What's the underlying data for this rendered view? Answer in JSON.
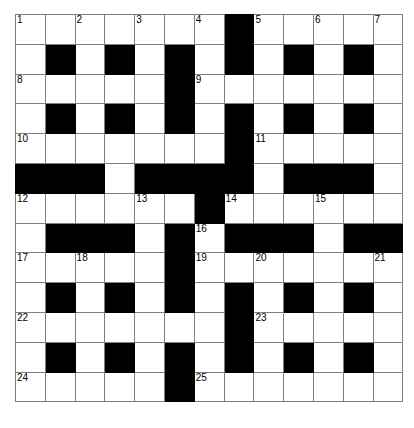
{
  "puzzle": {
    "kind": "crossword-grid",
    "rows": 13,
    "cols": 13,
    "cell_size_px": 28.8,
    "colors": {
      "fill": "#ffffff",
      "block": "#000000",
      "line": "#7f7f7f",
      "number": "#000000"
    },
    "grid": [
      [
        "w",
        "w",
        "w",
        "w",
        "w",
        "w",
        "w",
        "b",
        "w",
        "w",
        "w",
        "w",
        "w"
      ],
      [
        "w",
        "b",
        "w",
        "b",
        "w",
        "b",
        "w",
        "b",
        "w",
        "b",
        "w",
        "b",
        "w"
      ],
      [
        "w",
        "w",
        "w",
        "w",
        "w",
        "b",
        "w",
        "w",
        "w",
        "w",
        "w",
        "w",
        "w"
      ],
      [
        "w",
        "b",
        "w",
        "b",
        "w",
        "b",
        "w",
        "b",
        "w",
        "b",
        "w",
        "b",
        "w"
      ],
      [
        "w",
        "w",
        "w",
        "w",
        "w",
        "w",
        "w",
        "b",
        "w",
        "w",
        "w",
        "w",
        "w"
      ],
      [
        "b",
        "b",
        "b",
        "w",
        "b",
        "b",
        "b",
        "b",
        "w",
        "b",
        "b",
        "b",
        "w"
      ],
      [
        "w",
        "w",
        "w",
        "w",
        "w",
        "w",
        "b",
        "w",
        "w",
        "w",
        "w",
        "w",
        "w"
      ],
      [
        "w",
        "b",
        "b",
        "b",
        "w",
        "b",
        "w",
        "b",
        "b",
        "b",
        "w",
        "b",
        "b"
      ],
      [
        "w",
        "w",
        "w",
        "w",
        "w",
        "b",
        "w",
        "w",
        "w",
        "w",
        "w",
        "w",
        "w"
      ],
      [
        "w",
        "b",
        "w",
        "b",
        "w",
        "b",
        "w",
        "b",
        "w",
        "b",
        "w",
        "b",
        "w"
      ],
      [
        "w",
        "w",
        "w",
        "w",
        "w",
        "w",
        "w",
        "b",
        "w",
        "w",
        "w",
        "w",
        "w"
      ],
      [
        "w",
        "b",
        "w",
        "b",
        "w",
        "b",
        "w",
        "b",
        "w",
        "b",
        "w",
        "b",
        "w"
      ],
      [
        "w",
        "w",
        "w",
        "w",
        "w",
        "b",
        "w",
        "w",
        "w",
        "w",
        "w",
        "w",
        "w"
      ]
    ],
    "numbers": [
      {
        "row": 1,
        "col": 1,
        "label": "1"
      },
      {
        "row": 1,
        "col": 3,
        "label": "2"
      },
      {
        "row": 1,
        "col": 5,
        "label": "3"
      },
      {
        "row": 1,
        "col": 7,
        "label": "4"
      },
      {
        "row": 1,
        "col": 9,
        "label": "5"
      },
      {
        "row": 1,
        "col": 11,
        "label": "6"
      },
      {
        "row": 1,
        "col": 13,
        "label": "7"
      },
      {
        "row": 3,
        "col": 1,
        "label": "8"
      },
      {
        "row": 3,
        "col": 7,
        "label": "9"
      },
      {
        "row": 5,
        "col": 1,
        "label": "10"
      },
      {
        "row": 5,
        "col": 9,
        "label": "11"
      },
      {
        "row": 7,
        "col": 1,
        "label": "12"
      },
      {
        "row": 7,
        "col": 5,
        "label": "13"
      },
      {
        "row": 7,
        "col": 8,
        "label": "14"
      },
      {
        "row": 7,
        "col": 11,
        "label": "15"
      },
      {
        "row": 8,
        "col": 7,
        "label": "16"
      },
      {
        "row": 9,
        "col": 1,
        "label": "17"
      },
      {
        "row": 9,
        "col": 3,
        "label": "18"
      },
      {
        "row": 9,
        "col": 7,
        "label": "19"
      },
      {
        "row": 9,
        "col": 9,
        "label": "20"
      },
      {
        "row": 9,
        "col": 13,
        "label": "21"
      },
      {
        "row": 11,
        "col": 1,
        "label": "22"
      },
      {
        "row": 11,
        "col": 9,
        "label": "23"
      },
      {
        "row": 13,
        "col": 1,
        "label": "24"
      },
      {
        "row": 13,
        "col": 7,
        "label": "25"
      }
    ]
  }
}
